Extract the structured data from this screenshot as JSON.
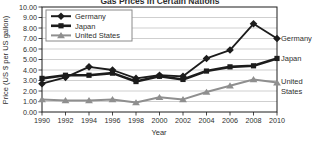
{
  "chart_data": {
    "type": "line",
    "title": "Gas Prices in Certain Nations",
    "xlabel": "Year",
    "ylabel": "Price (US $ per US gallon)",
    "x": [
      1990,
      1992,
      1994,
      1996,
      1998,
      2000,
      2002,
      2004,
      2006,
      2008,
      2010
    ],
    "ylim": [
      0,
      10
    ],
    "ytick_step": 1,
    "ytick_decimals": 2,
    "grid": true,
    "legend_position": "top-left",
    "series": [
      {
        "name": "Germany",
        "marker": "diamond",
        "color": "#1c1c1c",
        "line_width": 1.8,
        "values": [
          2.7,
          3.3,
          4.3,
          4.0,
          3.2,
          3.5,
          3.4,
          5.1,
          5.9,
          8.4,
          7.0
        ],
        "end_label": "Germany"
      },
      {
        "name": "Japan",
        "marker": "square",
        "color": "#1c1c1c",
        "line_width": 2.6,
        "values": [
          3.2,
          3.5,
          3.5,
          3.7,
          2.9,
          3.4,
          3.1,
          3.9,
          4.3,
          4.4,
          5.1
        ],
        "end_label": "Japan"
      },
      {
        "name": "United States",
        "marker": "triangle",
        "color": "#8f8f8f",
        "line_width": 2,
        "values": [
          1.2,
          1.1,
          1.1,
          1.2,
          0.9,
          1.4,
          1.2,
          1.9,
          2.5,
          3.1,
          2.8
        ],
        "end_label": "United States"
      }
    ]
  },
  "style": {
    "background": "#ffffff",
    "grid_color": "#cfcfcf",
    "axis_color": "#1c1c1c",
    "text_color": "#2e2e2e",
    "legend_bg": "#ffffff",
    "legend_border": "#8a8a8a"
  }
}
